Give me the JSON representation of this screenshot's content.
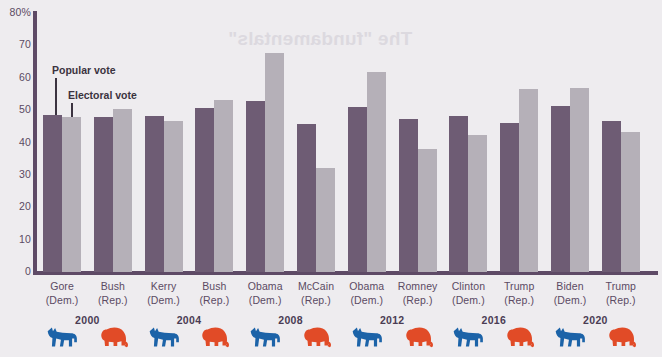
{
  "watermark_text": "The \"fundamentals\"",
  "legend": {
    "popular_label": "Popular vote",
    "electoral_label": "Electoral vote",
    "popular_color": "#6e5c74",
    "electoral_color": "#b5b0b8"
  },
  "axis": {
    "y_ticks": [
      "80%",
      "70",
      "60",
      "50",
      "40",
      "30",
      "20",
      "10",
      "0"
    ],
    "y_top_label": "80%",
    "y_zero_label": "0"
  },
  "party_colors": {
    "democrat": "#1c63a8",
    "republican": "#e14b27"
  },
  "years": [
    {
      "label": "2000"
    },
    {
      "label": "2004"
    },
    {
      "label": "2008"
    },
    {
      "label": "2012"
    },
    {
      "label": "2016"
    },
    {
      "label": "2020"
    }
  ],
  "candidates": [
    {
      "name": "Gore",
      "party": "(Dem.)",
      "party_key": "democrat"
    },
    {
      "name": "Bush",
      "party": "(Rep.)",
      "party_key": "republican"
    },
    {
      "name": "Kerry",
      "party": "(Dem.)",
      "party_key": "democrat"
    },
    {
      "name": "Bush",
      "party": "(Rep.)",
      "party_key": "republican"
    },
    {
      "name": "Obama",
      "party": "(Dem.)",
      "party_key": "democrat"
    },
    {
      "name": "McCain",
      "party": "(Rep.)",
      "party_key": "republican"
    },
    {
      "name": "Obama",
      "party": "(Dem.)",
      "party_key": "democrat"
    },
    {
      "name": "Romney",
      "party": "(Rep.)",
      "party_key": "republican"
    },
    {
      "name": "Clinton",
      "party": "(Dem.)",
      "party_key": "democrat"
    },
    {
      "name": "Trump",
      "party": "(Rep.)",
      "party_key": "republican"
    },
    {
      "name": "Biden",
      "party": "(Dem.)",
      "party_key": "democrat"
    },
    {
      "name": "Trump",
      "party": "(Rep.)",
      "party_key": "republican"
    }
  ],
  "chart_data": {
    "type": "bar",
    "title": "",
    "xlabel": "",
    "ylabel": "",
    "ylim": [
      0,
      80
    ],
    "ytick_step": 10,
    "grid": false,
    "legend_position": "inside-upper-left",
    "categories": [
      "Gore (Dem.) 2000",
      "Bush (Rep.) 2000",
      "Kerry (Dem.) 2004",
      "Bush (Rep.) 2004",
      "Obama (Dem.) 2008",
      "McCain (Rep.) 2008",
      "Obama (Dem.) 2012",
      "Romney (Rep.) 2012",
      "Clinton (Dem.) 2016",
      "Trump (Rep.) 2016",
      "Biden (Dem.) 2020",
      "Trump (Rep.) 2020"
    ],
    "series": [
      {
        "name": "Popular vote",
        "color": "#6e5c74",
        "values": [
          48.4,
          47.9,
          48.3,
          50.7,
          52.9,
          45.7,
          51.1,
          47.2,
          48.2,
          46.1,
          51.3,
          46.8
        ]
      },
      {
        "name": "Electoral vote",
        "color": "#b5b0b8",
        "values": [
          47.9,
          50.4,
          46.7,
          53.2,
          67.8,
          32.2,
          61.7,
          38.1,
          42.2,
          56.5,
          56.9,
          43.1
        ]
      }
    ]
  }
}
